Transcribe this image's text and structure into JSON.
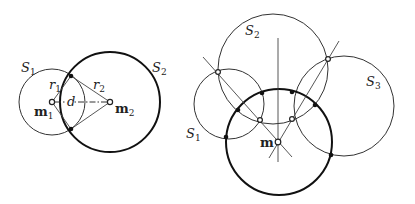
{
  "left_figure": {
    "labels": {
      "S1": {
        "main": "S",
        "sub": "1"
      },
      "S2": {
        "main": "S",
        "sub": "2"
      },
      "r1": {
        "main": "r",
        "sub": "1"
      },
      "r2": {
        "main": "r",
        "sub": "2"
      },
      "d": "d",
      "m1": {
        "main": "m",
        "sub": "1"
      },
      "m2": {
        "main": "m",
        "sub": "2"
      }
    },
    "circles": [
      {
        "name": "S1",
        "cx": 52,
        "cy": 102,
        "r": 33,
        "style": "thin"
      },
      {
        "name": "S2",
        "cx": 110,
        "cy": 102,
        "r": 50,
        "style": "thick"
      }
    ],
    "centers": [
      {
        "name": "m1",
        "x": 52,
        "y": 102
      },
      {
        "name": "m2",
        "x": 110,
        "y": 102
      }
    ],
    "intersections": [
      {
        "x": 71,
        "y": 76
      },
      {
        "x": 71,
        "y": 129
      }
    ]
  },
  "right_figure": {
    "labels": {
      "S1": {
        "main": "S",
        "sub": "1"
      },
      "S2": {
        "main": "S",
        "sub": "2"
      },
      "S3": {
        "main": "S",
        "sub": "3"
      },
      "m": "m"
    },
    "circles": [
      {
        "name": "S1",
        "cx": 229,
        "cy": 104,
        "r": 35,
        "style": "thin"
      },
      {
        "name": "S2",
        "cx": 273,
        "cy": 69,
        "r": 55,
        "style": "thin"
      },
      {
        "name": "S3",
        "cx": 344,
        "cy": 106,
        "r": 50,
        "style": "thin"
      },
      {
        "name": "S",
        "cx": 279,
        "cy": 142,
        "r": 53,
        "style": "thick"
      }
    ],
    "center": {
      "name": "m",
      "x": 278,
      "y": 142
    },
    "radical_axes": [
      {
        "x1": 278,
        "y1": 38,
        "x2": 278,
        "y2": 162
      },
      {
        "x1": 203,
        "y1": 57,
        "x2": 292,
        "y2": 157
      },
      {
        "x1": 339,
        "y1": 41,
        "x2": 269,
        "y2": 158
      }
    ],
    "open_points": [
      {
        "x": 218,
        "y": 72
      },
      {
        "x": 328,
        "y": 59
      },
      {
        "x": 260,
        "y": 120
      },
      {
        "x": 292,
        "y": 119
      }
    ],
    "solid_points": [
      {
        "x": 238,
        "y": 110
      },
      {
        "x": 262,
        "y": 94
      },
      {
        "x": 292,
        "y": 92
      },
      {
        "x": 315,
        "y": 105
      },
      {
        "x": 226,
        "y": 137
      },
      {
        "x": 331,
        "y": 155
      }
    ]
  }
}
